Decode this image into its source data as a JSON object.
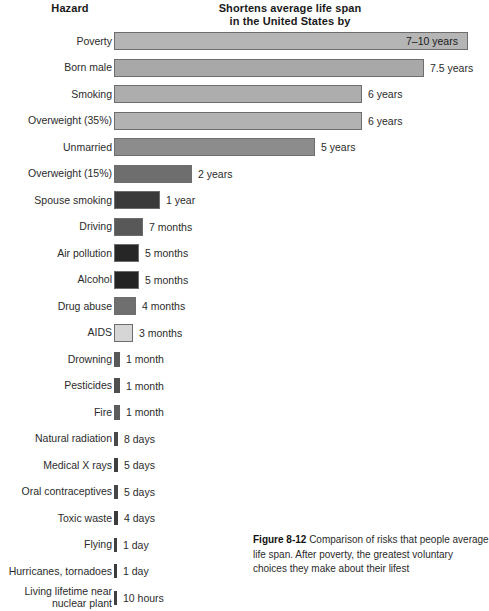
{
  "header": {
    "hazard_label": "Hazard",
    "value_label_line1": "Shortens average life span",
    "value_label_line2": "in the United States by"
  },
  "caption": {
    "figure_number": "Figure 8-12",
    "text": " Comparison of risks that people average life span. After poverty, the greatest voluntary choices they make about their lifest"
  },
  "chart_data": {
    "type": "bar",
    "title": "Shortens average life span in the United States by",
    "xlabel": "",
    "ylabel": "Hazard",
    "orientation": "horizontal",
    "grid": false,
    "legend": "none",
    "unit_note": "values expressed in years / months / days / hours of life span shortened",
    "categories": [
      "Poverty",
      "Born male",
      "Smoking",
      "Overweight (35%)",
      "Unmarried",
      "Overweight (15%)",
      "Spouse smoking",
      "Driving",
      "Air pollution",
      "Alcohol",
      "Drug abuse",
      "AIDS",
      "Drowning",
      "Pesticides",
      "Fire",
      "Natural radiation",
      "Medical X rays",
      "Oral contraceptives",
      "Toxic waste",
      "Flying",
      "Hurricanes, tornadoes",
      "Living lifetime near\nnuclear plant"
    ],
    "value_labels": [
      "7–10 years",
      "7.5 years",
      "6 years",
      "6 years",
      "5 years",
      "2 years",
      "1 year",
      "7 months",
      "5 months",
      "5 months",
      "4 months",
      "3 months",
      "1 month",
      "1 month",
      "1 month",
      "8 days",
      "5 days",
      "5 days",
      "4 days",
      "1 day",
      "1 day",
      "10 hours"
    ],
    "values_in_years": [
      8.5,
      7.5,
      6,
      6,
      5,
      2,
      1,
      0.583,
      0.417,
      0.417,
      0.333,
      0.25,
      0.083,
      0.083,
      0.083,
      0.0219,
      0.0137,
      0.0137,
      0.011,
      0.0027,
      0.0027,
      0.0011
    ],
    "bar_pixel_widths": [
      354,
      310,
      248,
      248,
      201,
      78,
      46,
      29,
      25,
      25,
      22,
      19,
      6,
      6,
      6,
      4,
      4,
      4,
      4,
      3,
      3,
      3
    ],
    "bar_colors": [
      "#b5b5b5",
      "#a8a8a8",
      "#adadad",
      "#b2b2b2",
      "#8c8c8c",
      "#6e6e6e",
      "#3a3a3a",
      "#585858",
      "#262626",
      "#242424",
      "#6f6f6f",
      "#d6d6d6",
      "#595959",
      "#4f4f4f",
      "#5c5c5c",
      "#4a4a4a",
      "#3f3f3f",
      "#474747",
      "#3c3c3c",
      "#414141",
      "#3b3b3b",
      "#404040"
    ],
    "label_inside_bar": [
      true,
      false,
      false,
      false,
      false,
      false,
      false,
      false,
      false,
      false,
      false,
      false,
      false,
      false,
      false,
      false,
      false,
      false,
      false,
      false,
      false,
      false
    ]
  }
}
